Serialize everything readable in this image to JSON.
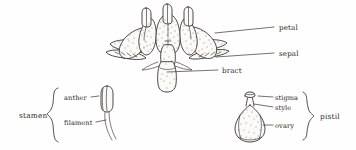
{
  "figure": {
    "style": "hand-drawn pen-and-ink botanical sketch",
    "background_color": "#fefefe",
    "ink_color": "#211d1a"
  },
  "flower": {
    "name": "whole-flower",
    "labels": [
      {
        "id": "petal",
        "text": "petal",
        "x": 279,
        "y": 28,
        "leader_from": [
          215,
          33
        ],
        "leader_to": [
          274,
          27
        ]
      },
      {
        "id": "sepal",
        "text": "sepal",
        "x": 279,
        "y": 54,
        "leader_from": [
          216,
          57
        ],
        "leader_to": [
          274,
          53
        ]
      },
      {
        "id": "bract",
        "text": "bract",
        "x": 222,
        "y": 70,
        "leader_from": [
          167,
          72
        ],
        "leader_to": [
          218,
          70
        ]
      }
    ]
  },
  "stamen": {
    "group_label": "stamen",
    "group_label_pos": {
      "x": 19,
      "y": 110
    },
    "brace": {
      "x": 52,
      "y_top": 88,
      "y_bottom": 142
    },
    "parts": [
      {
        "id": "anther",
        "text": "anther",
        "x": 66,
        "y": 98,
        "leader_from": [
          94,
          96
        ],
        "leader_to": [
          101,
          95
        ]
      },
      {
        "id": "filament",
        "text": "filament",
        "x": 66,
        "y": 123,
        "leader_from": [
          98,
          121
        ],
        "leader_to": [
          107,
          119
        ]
      }
    ]
  },
  "pistil": {
    "group_label": "pistil",
    "group_label_pos": {
      "x": 322,
      "y": 112
    },
    "brace": {
      "x": 307,
      "y_top": 92,
      "y_bottom": 140
    },
    "parts": [
      {
        "id": "stigma",
        "text": "stigma",
        "x": 274,
        "y": 99,
        "leader_from": [
          258,
          97
        ],
        "leader_to": [
          271,
          97
        ]
      },
      {
        "id": "style",
        "text": "style",
        "x": 274,
        "y": 108,
        "leader_from": [
          256,
          104
        ],
        "leader_to": [
          271,
          106
        ]
      },
      {
        "id": "ovary",
        "text": "ovary",
        "x": 274,
        "y": 126,
        "leader_from": [
          252,
          124
        ],
        "leader_to": [
          271,
          124
        ]
      }
    ]
  }
}
